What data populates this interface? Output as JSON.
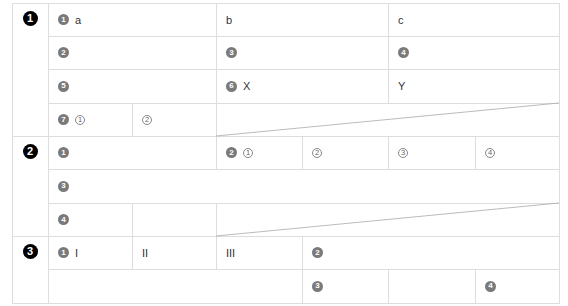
{
  "colors": {
    "line": "#dddddd",
    "diagonal": "#aaaaaa",
    "section_marker": "#000000",
    "sub_marker": "#7a7a7a"
  },
  "sections": [
    {
      "marker": "1",
      "cells": [
        {
          "id": "s1-r1-c1",
          "marker": "1",
          "text": "a"
        },
        {
          "id": "s1-r1-c2",
          "text": "b"
        },
        {
          "id": "s1-r1-c3",
          "text": "c"
        },
        {
          "id": "s1-r2-c1",
          "marker": "2"
        },
        {
          "id": "s1-r2-c2",
          "marker": "3"
        },
        {
          "id": "s1-r2-c3",
          "marker": "4"
        },
        {
          "id": "s1-r3-c1",
          "marker": "5"
        },
        {
          "id": "s1-r3-c2",
          "marker": "6",
          "text": "X"
        },
        {
          "id": "s1-r3-c3",
          "text": "Y"
        },
        {
          "id": "s1-r4-c1",
          "marker": "7",
          "sub": "1"
        },
        {
          "id": "s1-r4-c2",
          "sub": "2"
        },
        {
          "id": "s1-r4-diag",
          "diagonal": true
        }
      ]
    },
    {
      "marker": "2",
      "cells": [
        {
          "id": "s2-r1-c1",
          "marker": "1"
        },
        {
          "id": "s2-r1-c2",
          "marker": "2",
          "sub": "1"
        },
        {
          "id": "s2-r1-c3",
          "sub": "2"
        },
        {
          "id": "s2-r1-c4",
          "sub": "3"
        },
        {
          "id": "s2-r1-c5",
          "sub": "4"
        },
        {
          "id": "s2-r2-c1",
          "marker": "3"
        },
        {
          "id": "s2-r3-c1",
          "marker": "4"
        },
        {
          "id": "s2-r3-c2"
        },
        {
          "id": "s2-r3-diag",
          "diagonal": true
        }
      ]
    },
    {
      "marker": "3",
      "cells": [
        {
          "id": "s3-r1-c1",
          "marker": "1",
          "text": "I"
        },
        {
          "id": "s3-r1-c2",
          "text": "II"
        },
        {
          "id": "s3-r1-c3",
          "text": "III"
        },
        {
          "id": "s3-r1-c4",
          "marker": "2"
        },
        {
          "id": "s3-r2-c1"
        },
        {
          "id": "s3-r2-c2",
          "marker": "3"
        },
        {
          "id": "s3-r2-c3"
        },
        {
          "id": "s3-r2-c4",
          "marker": "4"
        }
      ]
    }
  ]
}
